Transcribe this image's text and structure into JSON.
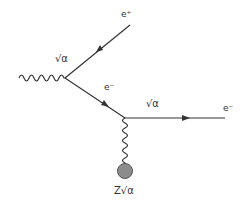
{
  "diagram": {
    "type": "feynman",
    "labels": {
      "positron": "e⁺",
      "electron_internal": "e⁻",
      "electron_out": "e⁻",
      "coupling_top": "√α",
      "coupling_bottom": "√α",
      "nucleus_coupling": "Z√α"
    },
    "colors": {
      "line": "#333333",
      "nucleus": "#8c8c8c",
      "background": "#ffffff"
    }
  }
}
